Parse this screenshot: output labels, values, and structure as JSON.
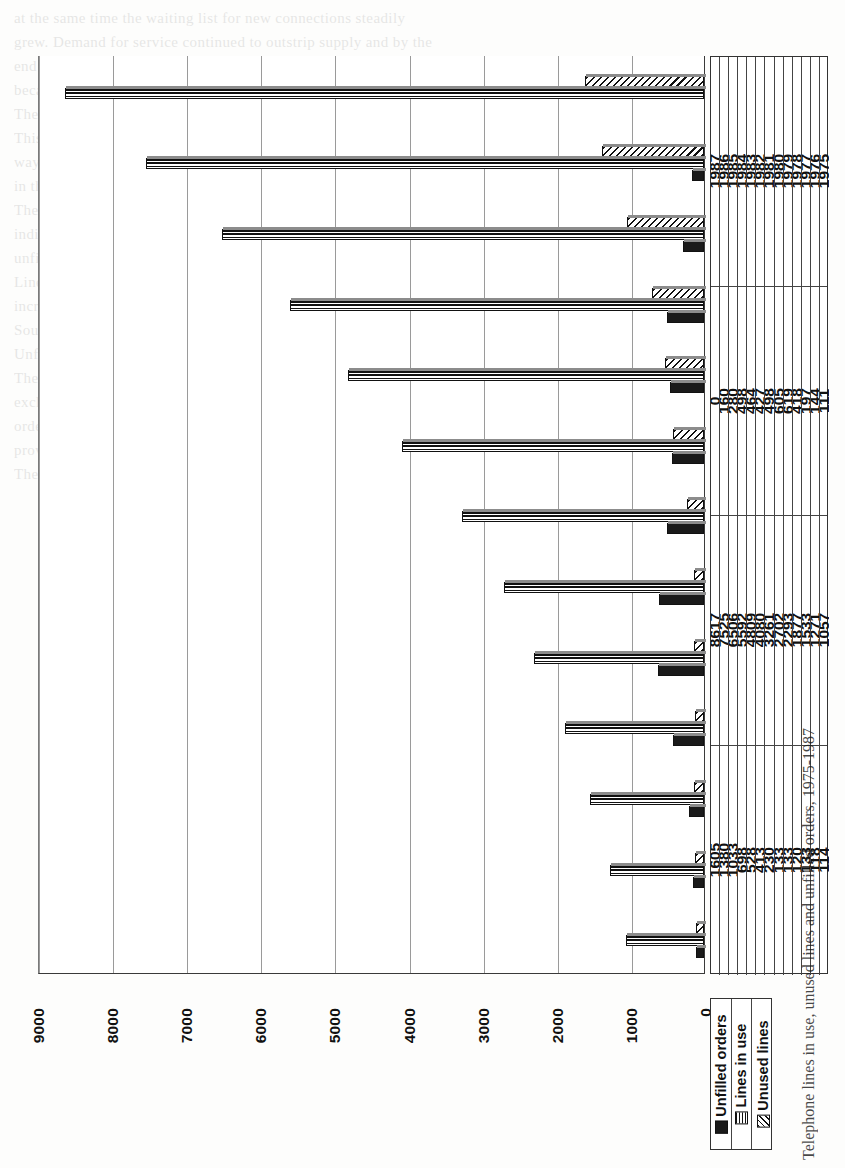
{
  "chart_data": {
    "type": "bar",
    "orientation": "horizontal",
    "title": "Telephone lines in use, unused lines and unfilled orders, 1975-1987",
    "xlabel": "",
    "ylabel": "",
    "categories": [
      "1975",
      "1976",
      "1977",
      "1978",
      "1979",
      "1980",
      "1981",
      "1982",
      "1983",
      "1984",
      "1985",
      "1986",
      "1987"
    ],
    "series": [
      {
        "name": "Unfilled orders",
        "values": [
          111,
          144,
          197,
          418,
          619,
          605,
          498,
          427,
          464,
          498,
          280,
          160,
          0
        ]
      },
      {
        "name": "Lines in use",
        "values": [
          1057,
          1271,
          1533,
          1877,
          2293,
          2702,
          3261,
          4080,
          4809,
          5592,
          6506,
          7525,
          8617
        ]
      },
      {
        "name": "Unused lines",
        "values": [
          114,
          118,
          133,
          120,
          133,
          133,
          230,
          413,
          528,
          698,
          1033,
          1380,
          1605
        ]
      }
    ],
    "axis_ticks": [
      9000,
      8000,
      7000,
      6000,
      5000,
      4000,
      3000,
      2000,
      1000,
      0
    ],
    "axis_min": 0,
    "axis_max": 9000,
    "grid": true,
    "legend_position": "bottom-right",
    "table_row_headers": [
      "Unfilled orders",
      "Lines in use",
      "Unused lines"
    ]
  },
  "legend": {
    "items": [
      {
        "label": "Unfilled orders",
        "marker": "solid-black-square",
        "color": "#1a1a1a"
      },
      {
        "label": "Lines in use",
        "marker": "horizontal-stripes",
        "color": "#111111"
      },
      {
        "label": "Unused lines",
        "marker": "diagonal-hatch",
        "color": "#111111"
      }
    ]
  },
  "ghost_text": [
    "at  the  same  time  the  waiting  list  for  new  connections  steadily",
    "grew.  Demand  for  service  continued  to  outstrip  supply  and  by  the",
    "end  of  the  period  the  number  of  unfilled  orders  had  fallen  only",
    "because  registration  was  suspended  in  several  exchanges.",
    "",
    "",
    "The  growth  in  lines  in  use  over  the  period  was  remarkable.",
    "",
    "",
    "This  figure  should  be  treated  with  caution  because  of  the",
    "way  it  is  derived.    The  number  of  unused  lines  grew  rapidly",
    "in  the  later  years,  rising  to  more  than  1,600  in  1987.",
    "",
    "",
    "The  table  below  the  chart  repeats  the  plotted  values  so  that",
    "individual  years  can  be  compared  directly.    Note  that  the",
    "unfilled  orders  series  reaches  zero  in  1987.",
    "",
    "",
    "Lines  in  use  rose  from  1,057  in  1975  to  8,617  in  1987,  an",
    "increase  of  over  eight  times  in  thirteen  years.",
    "",
    "",
    "Sources:  annual  reports  and  statistical  returns.",
    "",
    "",
    "Unfilled  orders  and  waiting  lists",
    "",
    "The  registration  of  new  applicants  was  suspended  in  some",
    "exchanges,  which  reduced  the  recorded  total  of  unfilled",
    "orders  without  any  real  improvement  in  the  level  of  service",
    "provided  to  the  public.",
    "",
    "The  figures  in  the  table  are  rounded  to  the  nearest  whole  line."
  ]
}
